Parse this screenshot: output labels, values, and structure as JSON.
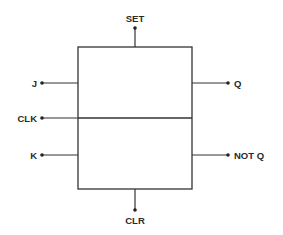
{
  "diagram": {
    "type": "JK flip-flop block diagram",
    "colors": {
      "line": "#333333",
      "text": "#2a2a2a",
      "background": "#ffffff"
    },
    "block": {
      "x": 78,
      "y": 47,
      "width": 114,
      "height": 142,
      "divider_y": 118
    },
    "pins": {
      "set": {
        "label": "SET",
        "side": "top"
      },
      "j": {
        "label": "J",
        "side": "left"
      },
      "clk": {
        "label": "CLK",
        "side": "left"
      },
      "k": {
        "label": "K",
        "side": "left"
      },
      "q": {
        "label": "Q",
        "side": "right"
      },
      "notq": {
        "label": "NOT Q",
        "side": "right"
      },
      "clr": {
        "label": "CLR",
        "side": "bottom"
      }
    }
  }
}
